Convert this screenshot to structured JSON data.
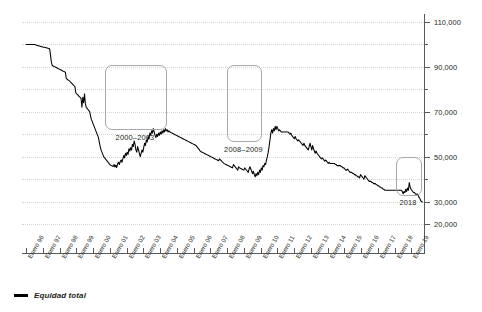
{
  "chart_data": {
    "type": "line",
    "title": "",
    "xlabel": "",
    "ylabel": "",
    "grid": true,
    "legend_position": "bottom-left",
    "ylim": [
      10000,
      115000
    ],
    "y_ticks_labeled": [
      "110,000",
      "90,000",
      "70,000",
      "50,000",
      "30,000",
      "20,000"
    ],
    "y_tick_values_labeled": [
      110000,
      90000,
      70000,
      50000,
      30000,
      20000
    ],
    "y_minor_ticks": [
      100000,
      80000,
      60000,
      40000
    ],
    "x_tick_labels": [
      "Enero 96",
      "Enero 97",
      "Enero 98",
      "Enero 99",
      "Enero 00",
      "Enero 01",
      "Enero 02",
      "Enero 03",
      "Enero 04",
      "Enero 05",
      "Enero 06",
      "Enero 07",
      "Enero 08",
      "Enero 09",
      "Enero 10",
      "Enero 11",
      "Enero 12",
      "Enero 13",
      "Enero 14",
      "Enero 15",
      "Enero 16",
      "Enero 17",
      "Enero 18",
      "Enero 19"
    ],
    "series": [
      {
        "name": "Equidad total",
        "color": "#000000",
        "values": [
          100000,
          100000,
          100000,
          100000,
          100000,
          100000,
          100000,
          100000,
          100000,
          100000,
          100000,
          99800,
          99600,
          99500,
          99400,
          99300,
          99200,
          99100,
          99000,
          98900,
          98800,
          98700,
          98600,
          98500,
          98400,
          98300,
          98200,
          98000,
          95000,
          92000,
          90600,
          90400,
          90200,
          90000,
          89800,
          89600,
          89400,
          89200,
          89000,
          88800,
          88600,
          88400,
          88200,
          88000,
          87800,
          87600,
          85000,
          84500,
          84200,
          84000,
          83600,
          83200,
          82800,
          82400,
          82000,
          81600,
          81200,
          78500,
          78000,
          77600,
          77200,
          76800,
          76400,
          76000,
          72000,
          76500,
          74000,
          78000,
          73500,
          72000,
          71500,
          71000,
          70500,
          70000,
          68000,
          66500,
          65500,
          64500,
          63500,
          62500,
          61500,
          60500,
          59500,
          58500,
          56500,
          54500,
          53000,
          52000,
          51000,
          50000,
          49500,
          49000,
          48500,
          48000,
          47500,
          47000,
          46500,
          46200,
          46000,
          45800,
          45600,
          46500,
          45400,
          46200,
          45200,
          46800,
          47500,
          46500,
          47800,
          48500,
          47500,
          49000,
          50500,
          49500,
          51500,
          50500,
          52000,
          51000,
          53500,
          52500,
          54000,
          53000,
          55500,
          54500,
          57000,
          55500,
          53000,
          52000,
          54500,
          53000,
          51500,
          50000,
          51500,
          53000,
          52000,
          54000,
          56000,
          55000,
          57500,
          56500,
          59000,
          58000,
          60500,
          59500,
          61500,
          60500,
          62500,
          61000,
          59500,
          58500,
          60000,
          59000,
          60500,
          59500,
          61000,
          60000,
          61500,
          60500,
          62000,
          61000,
          62500,
          61500,
          62000,
          61000,
          61500,
          61000,
          60800,
          60600,
          60400,
          60200,
          60000,
          59800,
          59600,
          59400,
          59200,
          59000,
          58800,
          58600,
          58400,
          58200,
          58000,
          57800,
          57600,
          57400,
          57200,
          57000,
          56800,
          56600,
          56400,
          56200,
          56000,
          55800,
          55600,
          55400,
          55200,
          55000,
          54500,
          54000,
          53500,
          53000,
          52500,
          52200,
          52000,
          51800,
          51600,
          51400,
          51200,
          51000,
          50800,
          50600,
          50400,
          50200,
          50000,
          49800,
          49600,
          49400,
          49200,
          49000,
          48800,
          48600,
          48400,
          48200,
          49000,
          48600,
          48200,
          47800,
          47400,
          47000,
          46800,
          46600,
          46400,
          46200,
          46000,
          45800,
          45600,
          45400,
          45200,
          45000,
          46500,
          46000,
          45500,
          45000,
          44500,
          44000,
          45500,
          45000,
          44800,
          44600,
          44400,
          44200,
          44000,
          45000,
          44500,
          44000,
          43500,
          43000,
          44500,
          45500,
          44500,
          43500,
          42500,
          43500,
          42000,
          41000,
          42500,
          41500,
          43000,
          42000,
          44000,
          43000,
          45000,
          44000,
          46000,
          45500,
          47000,
          46500,
          48500,
          50000,
          52000,
          54500,
          57500,
          60500,
          62000,
          60500,
          62500,
          61500,
          63500,
          62000,
          63500,
          62500,
          61500,
          62000,
          61500,
          61000,
          61000,
          61000,
          61000,
          61000,
          61000,
          61000,
          61000,
          61000,
          60500,
          60000,
          60500,
          59500,
          59000,
          58500,
          58000,
          59000,
          58000,
          57500,
          57000,
          57500,
          57000,
          56500,
          56000,
          55500,
          55000,
          56000,
          55000,
          54500,
          54000,
          53500,
          53000,
          54500,
          56000,
          54500,
          53000,
          55000,
          53500,
          52500,
          51500,
          52500,
          51500,
          51000,
          50500,
          50000,
          49500,
          49000,
          49500,
          49000,
          48500,
          48000,
          48500,
          48000,
          47500,
          47000,
          47500,
          47000,
          47000,
          47000,
          47000,
          47000,
          47000,
          46500,
          46500,
          46000,
          46000,
          46000,
          46000,
          46000,
          45500,
          45500,
          45000,
          45000,
          44500,
          44000,
          44000,
          44500,
          44000,
          43500,
          43000,
          43000,
          43000,
          42500,
          42500,
          42000,
          42000,
          41500,
          41500,
          41000,
          41000,
          40500,
          42000,
          41500,
          41000,
          40500,
          40000,
          41500,
          41000,
          40500,
          40000,
          39500,
          39000,
          39000,
          39000,
          38500,
          38500,
          38000,
          38000,
          38000,
          37500,
          37500,
          37000,
          37000,
          36500,
          36500,
          36000,
          36000,
          35500,
          35500,
          35000,
          35000,
          35000,
          35000,
          35000,
          35000,
          35000,
          35000,
          35000,
          35000,
          35000,
          35000,
          35000,
          35000,
          35000,
          35000,
          35000,
          35000,
          35000,
          35000,
          34500,
          33500,
          34500,
          34000,
          35500,
          34500,
          36000,
          35000,
          38500,
          36500,
          35500,
          35000,
          34500,
          34000,
          34000,
          33500,
          33000,
          33500,
          33000,
          32000,
          31500,
          30500,
          30000,
          29800
        ]
      }
    ],
    "annotations": [
      {
        "label": "2000–2003",
        "color": "#a7a9ac"
      },
      {
        "label": "2008–2009",
        "color": "#a7a9ac"
      },
      {
        "label": "2018",
        "color": "#a7a9ac"
      }
    ]
  },
  "legend": {
    "label": "Equidad total",
    "color": "#000000"
  }
}
